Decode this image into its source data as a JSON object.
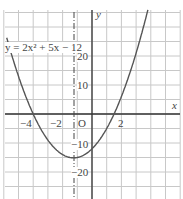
{
  "chart_data": {
    "type": "line",
    "title": "",
    "equation": "y = 2x² + 5x − 12",
    "xlabel": "x",
    "ylabel": "y",
    "origin_label": "O",
    "x_ticks": [
      {
        "v": -4,
        "label": "−4"
      },
      {
        "v": -2,
        "label": "−2"
      },
      {
        "v": 2,
        "label": "2"
      }
    ],
    "y_ticks": [
      {
        "v": 20,
        "label": "20"
      },
      {
        "v": 10,
        "label": "10"
      },
      {
        "v": -10,
        "label": "−10"
      },
      {
        "v": -20,
        "label": "−20"
      }
    ],
    "xlim": [
      -6,
      5.5
    ],
    "ylim": [
      -26,
      38
    ],
    "grid": true,
    "axis_of_symmetry": -1.25,
    "vertex": [
      -1.25,
      -15.125
    ],
    "roots": [
      -4,
      1.5
    ],
    "y_intercept": -12,
    "curve_x_range": [
      -5.8,
      3.8
    ]
  },
  "labels": {
    "equation": "y = 2x² + 5x − 12",
    "x_axis": "x",
    "y_axis": "y",
    "origin": "O",
    "tick_neg4": "−4",
    "tick_neg2": "−2",
    "tick_2": "2",
    "tick_20": "20",
    "tick_10": "10",
    "tick_neg10": "−10",
    "tick_neg20": "−20"
  }
}
